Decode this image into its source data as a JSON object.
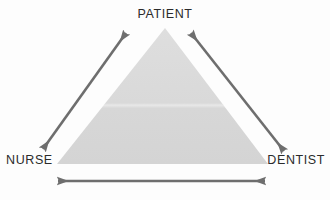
{
  "diagram": {
    "type": "triangle-relationship",
    "background_color": "#fdfdfd",
    "triangle": {
      "name": "care-triangle",
      "fill_color": "#d8d8d8",
      "seam_color": "#e8e8e8",
      "apex": {
        "x": 165,
        "y": 28
      },
      "base_left": {
        "x": 57,
        "y": 164
      },
      "base_right": {
        "x": 268,
        "y": 164
      },
      "seam_y": 105
    },
    "nodes": [
      {
        "id": "patient",
        "label": "PATIENT",
        "position": "top-center"
      },
      {
        "id": "nurse",
        "label": "NURSE",
        "position": "bottom-left"
      },
      {
        "id": "dentist",
        "label": "DENTIST",
        "position": "bottom-right"
      }
    ],
    "connectors": [
      {
        "id": "nurse-patient",
        "from": "NURSE",
        "to": "PATIENT",
        "style": "double-headed-arrow",
        "color": "#6e6e6e",
        "x1": 43,
        "y1": 149,
        "x2": 126,
        "y2": 33
      },
      {
        "id": "patient-dentist",
        "from": "PATIENT",
        "to": "DENTIST",
        "style": "double-headed-arrow",
        "color": "#6e6e6e",
        "x1": 191,
        "y1": 33,
        "x2": 284,
        "y2": 151
      },
      {
        "id": "nurse-dentist",
        "from": "NURSE",
        "to": "DENTIST",
        "style": "double-headed-arrow",
        "color": "#6e6e6e",
        "x1": 58,
        "y1": 181,
        "x2": 265,
        "y2": 181
      }
    ],
    "label_color": "#2b2b2b"
  }
}
